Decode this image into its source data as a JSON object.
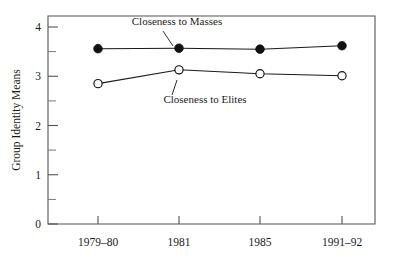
{
  "chart_data": {
    "type": "line",
    "title": "",
    "xlabel": "",
    "ylabel": "Group Identity Means",
    "categories": [
      "1979–80",
      "1981",
      "1985",
      "1991–92"
    ],
    "ylim": [
      0,
      4
    ],
    "yticks": [
      0,
      1,
      2,
      3,
      4
    ],
    "ytick_labels": [
      "0",
      "1",
      "2",
      "3",
      "4"
    ],
    "yticks_minor": [
      0.5,
      1.5,
      2.5,
      3.5
    ],
    "grid": false,
    "legend": "inline-annotations",
    "series": [
      {
        "name": "Closeness to Masses",
        "marker": "filled-circle",
        "values": [
          3.56,
          3.57,
          3.55,
          3.62
        ]
      },
      {
        "name": "Closeness to Elites",
        "marker": "open-circle",
        "values": [
          2.85,
          3.13,
          3.05,
          3.01
        ]
      }
    ],
    "annotations": [
      {
        "text": "Closeness to Masses",
        "series": "Closeness to Masses"
      },
      {
        "text": "Closeness to Elites",
        "series": "Closeness to Elites"
      }
    ]
  },
  "axes": {
    "y_title": "Group Identity Means",
    "y_tick_0": "0",
    "y_tick_1": "1",
    "y_tick_2": "2",
    "y_tick_3": "3",
    "y_tick_4": "4",
    "x_tick_0": "1979–80",
    "x_tick_1": "1981",
    "x_tick_2": "1985",
    "x_tick_3": "1991–92"
  },
  "labels": {
    "masses": "Closeness to Masses",
    "elites": "Closeness to Elites"
  },
  "colors": {
    "frame": "#545454",
    "line": "#1a1a1a",
    "marker_filled": "#111111",
    "marker_open_fill": "#ffffff",
    "background": "#ffffff",
    "text": "#1a1a1a"
  }
}
